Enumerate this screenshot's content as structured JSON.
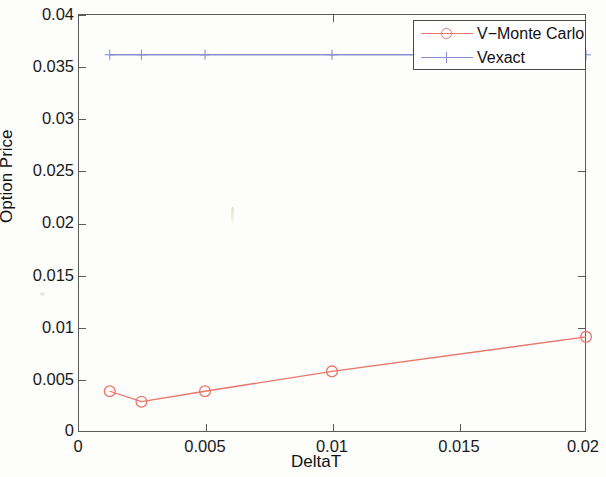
{
  "chart_data": {
    "type": "line",
    "title": "",
    "xlabel": "DeltaT",
    "ylabel": "Option Price",
    "xlim": [
      0,
      0.02
    ],
    "ylim": [
      0,
      0.04
    ],
    "xticks": [
      "0",
      "0.005",
      "0.01",
      "0.015",
      "0.02"
    ],
    "xtick_values": [
      0,
      0.005,
      0.01,
      0.015,
      0.02
    ],
    "yticks": [
      "0",
      "0.005",
      "0.01",
      "0.015",
      "0.02",
      "0.025",
      "0.03",
      "0.035",
      "0.04"
    ],
    "ytick_values": [
      0,
      0.005,
      0.01,
      0.015,
      0.02,
      0.025,
      0.03,
      0.035,
      0.04
    ],
    "grid": false,
    "legend_position": "top-right",
    "series": [
      {
        "name": "V-Monte Carlo",
        "color": "#e8766a",
        "marker": "circle",
        "x": [
          0.00125,
          0.0025,
          0.005,
          0.01,
          0.02
        ],
        "values": [
          0.0039,
          0.0029,
          0.0039,
          0.0058,
          0.0091
        ]
      },
      {
        "name": "Vexact",
        "color": "#8a8ed0",
        "marker": "plus",
        "x": [
          0.00125,
          0.0025,
          0.005,
          0.01,
          0.02
        ],
        "values": [
          0.0361,
          0.0361,
          0.0361,
          0.0361,
          0.0361
        ]
      }
    ]
  },
  "legend": {
    "entries": [
      {
        "label": "V−Monte Carlo"
      },
      {
        "label": "Vexact"
      }
    ]
  },
  "axes": {
    "x_title": "DeltaT",
    "y_title": "Option Price",
    "x_tick_labels": [
      "0",
      "0.005",
      "0.01",
      "0.015",
      "0.02"
    ],
    "y_tick_labels": [
      "0.04",
      "0.035",
      "0.03",
      "0.025",
      "0.02",
      "0.015",
      "0.01",
      "0.005",
      "0"
    ]
  },
  "colors": {
    "monte_carlo": "#e8766a",
    "vexact": "#8a8ed0",
    "axis": "#5a5a5a",
    "background": "#fdfdfb"
  }
}
